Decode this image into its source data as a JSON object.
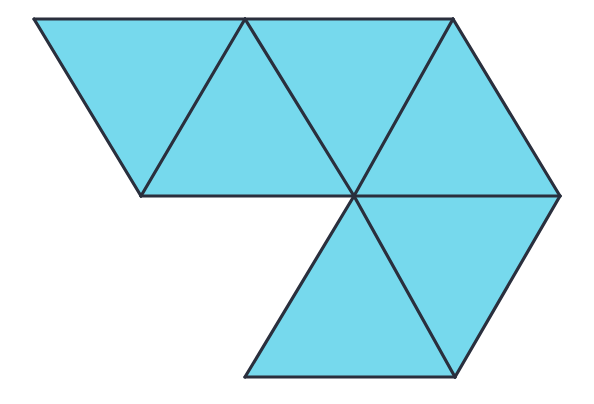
{
  "figure": {
    "canvas": {
      "width": 594,
      "height": 404
    },
    "background_color": "#ffffff",
    "fill_color": "#76d9ed",
    "edge_color": "#2a2f3d",
    "edge_width": 3.2,
    "triangle_count": 6,
    "vertices": {
      "A": {
        "label": "A",
        "x": 34,
        "y": 19
      },
      "B": {
        "label": "B",
        "x": 245,
        "y": 19
      },
      "C": {
        "label": "C",
        "x": 453,
        "y": 19
      },
      "D": {
        "label": "D",
        "x": 141,
        "y": 196
      },
      "E": {
        "label": "E",
        "x": 354,
        "y": 196
      },
      "F": {
        "label": "F",
        "x": 560,
        "y": 196
      },
      "G": {
        "label": "G",
        "x": 245,
        "y": 377
      },
      "H": {
        "label": "H",
        "x": 455,
        "y": 377
      }
    },
    "triangles": [
      {
        "name": "triangle-1-top-left",
        "orientation": "down",
        "points": "34,19 245,19 141,196"
      },
      {
        "name": "triangle-2-top-middle-left",
        "orientation": "up",
        "points": "245,19 354,196 141,196"
      },
      {
        "name": "triangle-3-top-middle-right",
        "orientation": "down",
        "points": "245,19 453,19 354,196"
      },
      {
        "name": "triangle-4-top-right",
        "orientation": "up",
        "points": "453,19 560,196 354,196"
      },
      {
        "name": "triangle-5-bottom-left",
        "orientation": "down",
        "points": "354,196 245,377 455,377"
      },
      {
        "name": "triangle-6-bottom-right",
        "orientation": "up",
        "points": "354,196 560,196 455,377"
      }
    ],
    "edges": [
      {
        "name": "edge-top-A-B",
        "d": "M 34,19 L 245,19"
      },
      {
        "name": "edge-top-B-C",
        "d": "M 245,19 L 453,19"
      },
      {
        "name": "edge-left-A-D",
        "d": "M 34,19 L 141,196"
      },
      {
        "name": "edge-inner-B-D",
        "d": "M 245,19 L 141,196"
      },
      {
        "name": "edge-inner-B-E",
        "d": "M 245,19 L 354,196"
      },
      {
        "name": "edge-inner-C-E",
        "d": "M 453,19 L 354,196"
      },
      {
        "name": "edge-right-C-F",
        "d": "M 453,19 L 560,196"
      },
      {
        "name": "edge-middle-D-E",
        "d": "M 141,196 L 354,196"
      },
      {
        "name": "edge-middle-E-F",
        "d": "M 354,196 L 560,196"
      },
      {
        "name": "edge-inner-E-G",
        "d": "M 354,196 L 245,377"
      },
      {
        "name": "edge-inner-E-H",
        "d": "M 354,196 L 455,377"
      },
      {
        "name": "edge-right-F-H",
        "d": "M 560,196 L 455,377"
      },
      {
        "name": "edge-bottom-G-H",
        "d": "M 245,377 L 455,377"
      }
    ]
  }
}
